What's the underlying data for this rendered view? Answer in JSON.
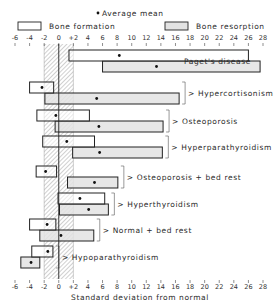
{
  "chart_data": {
    "type": "bar",
    "subtype": "floating-range",
    "title": "",
    "xlabel": "Standard deviation from normal",
    "ylabel": "",
    "xlim": [
      -6,
      28
    ],
    "x_ticks": [
      "-6",
      "-4",
      "-2",
      "0",
      "+2",
      "4",
      "6",
      "8",
      "10",
      "12",
      "14",
      "16",
      "18",
      "20",
      "22",
      "24",
      "26",
      "28"
    ],
    "x_tick_values": [
      -6,
      -4,
      -2,
      0,
      2,
      4,
      6,
      8,
      10,
      12,
      14,
      16,
      18,
      20,
      22,
      24,
      26,
      28
    ],
    "normal_band": [
      -2,
      2
    ],
    "reference_line": 0,
    "legend": {
      "mean_label": "Average mean",
      "formation_label": "Bone formation",
      "resorption_label": "Bone resorption"
    },
    "series": [
      {
        "name": "Bone formation",
        "color": "#ffffff"
      },
      {
        "name": "Bone resorption",
        "color": "#e3e3e3"
      }
    ],
    "categories": [
      {
        "name": "Paget's disease",
        "formation": {
          "min": 1.4,
          "max": 26.0,
          "mean": 8.3
        },
        "resorption": {
          "min": 6.0,
          "max": 27.6,
          "mean": 13.4
        }
      },
      {
        "name": "Hypercortisonism",
        "formation": {
          "min": -4.0,
          "max": -0.7,
          "mean": -2.3
        },
        "resorption": {
          "min": -1.9,
          "max": 16.5,
          "mean": 5.2
        }
      },
      {
        "name": "Osteoporosis",
        "formation": {
          "min": -3.0,
          "max": 4.2,
          "mean": -0.4
        },
        "resorption": {
          "min": -0.5,
          "max": 14.3,
          "mean": 5.5
        }
      },
      {
        "name": "Hyperparathyroidism",
        "formation": {
          "min": -2.2,
          "max": 4.9,
          "mean": 1.1
        },
        "resorption": {
          "min": 1.9,
          "max": 14.2,
          "mean": 5.6
        }
      },
      {
        "name": "Osteoporosis + bed rest",
        "formation": {
          "min": -3.1,
          "max": -0.3,
          "mean": -1.8
        },
        "resorption": {
          "min": 1.2,
          "max": 8.1,
          "mean": 4.9
        }
      },
      {
        "name": "Hyperthyroidism",
        "formation": {
          "min": -0.1,
          "max": 6.3,
          "mean": 2.9
        },
        "resorption": {
          "min": 0.1,
          "max": 6.8,
          "mean": 4.1
        }
      },
      {
        "name": "Normal + bed rest",
        "formation": {
          "min": -4.0,
          "max": -0.4,
          "mean": -1.6
        },
        "resorption": {
          "min": -2.6,
          "max": 4.8,
          "mean": 0.3
        }
      },
      {
        "name": "Hypoparathyroidism",
        "formation": {
          "min": -3.7,
          "max": -0.8,
          "mean": -1.5
        },
        "resorption": {
          "min": -5.2,
          "max": -2.6,
          "mean": -3.8
        }
      }
    ]
  }
}
